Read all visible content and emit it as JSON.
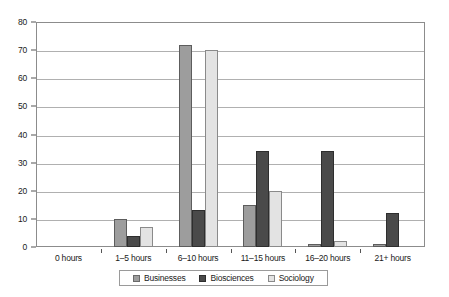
{
  "chart_data": {
    "type": "bar",
    "title": "",
    "subtitle": "",
    "xlabel": "",
    "ylabel": "",
    "ylim": [
      0,
      80
    ],
    "ytick_step": 10,
    "yticks": [
      0,
      10,
      20,
      30,
      40,
      50,
      60,
      70,
      80
    ],
    "grid": true,
    "legend_position": "bottom",
    "categories": [
      "0 hours",
      "1–5 hours",
      "6–10 hours",
      "11–15 hours",
      "16–20 hours",
      "21+ hours"
    ],
    "series": [
      {
        "name": "Businesses",
        "color": "#9d9d9d",
        "values": [
          0,
          10,
          72,
          15,
          1,
          1
        ]
      },
      {
        "name": "Biosciences",
        "color": "#4a4a4a",
        "values": [
          0,
          4,
          13,
          34,
          34,
          12
        ]
      },
      {
        "name": "Sociology",
        "color": "#e3e3e3",
        "values": [
          0,
          7,
          70,
          20,
          2,
          0
        ]
      }
    ]
  },
  "axes": {
    "y_tick_labels": [
      "0",
      "10",
      "20",
      "30",
      "40",
      "50",
      "60",
      "70",
      "80"
    ],
    "x_tick_labels": [
      "0 hours",
      "1–5 hours",
      "6–10 hours",
      "11–15 hours",
      "16–20 hours",
      "21+ hours"
    ]
  },
  "legend": {
    "items": [
      {
        "label": "Businesses",
        "swatch": "s0"
      },
      {
        "label": "Biosciences",
        "swatch": "s1"
      },
      {
        "label": "Sociology",
        "swatch": "s2"
      }
    ]
  }
}
